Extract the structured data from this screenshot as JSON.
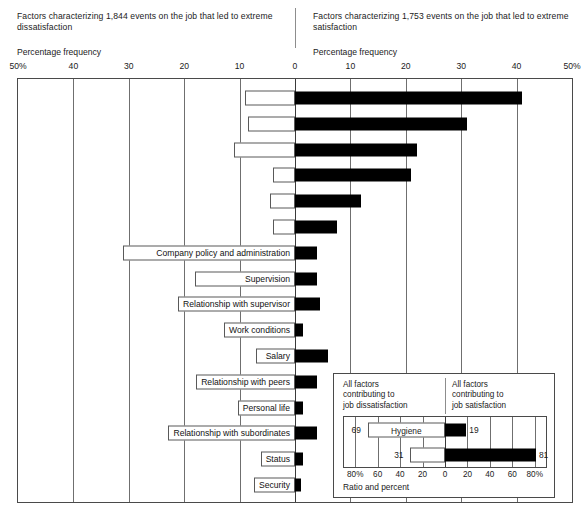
{
  "header": {
    "left_title": "Factors characterizing 1,844 events on the job that led to extreme dissatisfaction",
    "right_title": "Factors characterizing 1,753 events on the job that led to extreme satisfaction",
    "left_axis_caption": "Percentage frequency",
    "right_axis_caption": "Percentage frequency"
  },
  "chart_data": {
    "type": "bar",
    "orientation": "horizontal-diverging",
    "xlabel": "Percentage frequency",
    "xlim": [
      -50,
      50
    ],
    "xticks": [
      -50,
      -40,
      -30,
      -20,
      -10,
      0,
      10,
      20,
      30,
      40,
      50
    ],
    "xticklabels": [
      "50%",
      "40",
      "30",
      "20",
      "10",
      "0",
      "10",
      "20",
      "30",
      "40",
      "50%"
    ],
    "grid": true,
    "legend": "none",
    "series": [
      {
        "name": "Factors leading to extreme dissatisfaction",
        "color": "#ffffff",
        "side": "left"
      },
      {
        "name": "Factors leading to extreme satisfaction",
        "color": "#000000",
        "side": "right"
      }
    ],
    "categories": [
      "",
      "",
      "",
      "",
      "",
      "",
      "Company policy and administration",
      "Supervision",
      "Relationship with supervisor",
      "Work conditions",
      "Salary",
      "Relationship with peers",
      "Personal life",
      "Relationship with subordinates",
      "Status",
      "Security"
    ],
    "rows": [
      {
        "label": "",
        "dissatisfaction": 9.0,
        "satisfaction": 41.0
      },
      {
        "label": "",
        "dissatisfaction": 8.5,
        "satisfaction": 31.0
      },
      {
        "label": "",
        "dissatisfaction": 11.0,
        "satisfaction": 22.0
      },
      {
        "label": "",
        "dissatisfaction": 4.0,
        "satisfaction": 21.0
      },
      {
        "label": "",
        "dissatisfaction": 4.5,
        "satisfaction": 12.0
      },
      {
        "label": "",
        "dissatisfaction": 4.0,
        "satisfaction": 7.5
      },
      {
        "label": "Company policy and administration",
        "dissatisfaction": 31.0,
        "satisfaction": 4.0
      },
      {
        "label": "Supervision",
        "dissatisfaction": 18.0,
        "satisfaction": 4.0
      },
      {
        "label": "Relationship with supervisor",
        "dissatisfaction": 10.0,
        "satisfaction": 4.5
      },
      {
        "label": "Work conditions",
        "dissatisfaction": 9.0,
        "satisfaction": 1.5
      },
      {
        "label": "Salary",
        "dissatisfaction": 7.0,
        "satisfaction": 6.0
      },
      {
        "label": "Relationship with peers",
        "dissatisfaction": 5.5,
        "satisfaction": 4.0
      },
      {
        "label": "Personal life",
        "dissatisfaction": 4.0,
        "satisfaction": 1.5
      },
      {
        "label": "Relationship with subordinates",
        "dissatisfaction": 4.0,
        "satisfaction": 4.0
      },
      {
        "label": "Status",
        "dissatisfaction": 3.0,
        "satisfaction": 1.5
      },
      {
        "label": "Security",
        "dissatisfaction": 3.0,
        "satisfaction": 1.0
      }
    ]
  },
  "inset": {
    "caption_left": "All factors\ncontributing to\njob dissatisfaction",
    "caption_right": "All factors\ncontributing to\njob satisfaction",
    "axis_title": "Ratio and percent",
    "xticklabels": [
      "80%",
      "60",
      "40",
      "20",
      "0",
      "20",
      "40",
      "60",
      "80%"
    ],
    "xticks": [
      -80,
      -60,
      -40,
      -20,
      0,
      20,
      40,
      60,
      80
    ],
    "xlim": [
      -90,
      90
    ],
    "rows": [
      {
        "label": "Hygiene",
        "dissatisfaction": 69,
        "satisfaction": 19
      },
      {
        "label": "",
        "dissatisfaction": 31,
        "satisfaction": 81
      }
    ]
  }
}
